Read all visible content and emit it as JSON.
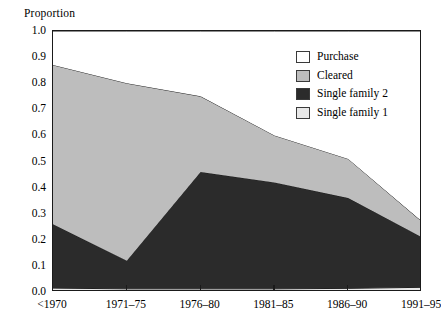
{
  "chart_data": {
    "type": "area",
    "stacked": true,
    "title": "",
    "subtitle": "",
    "xlabel": "",
    "ylabel": "Proportion",
    "ylim": [
      0.0,
      1.0
    ],
    "grid": false,
    "legend_position": "upper-right",
    "categories": [
      "<1970",
      "1971–75",
      "1976–80",
      "1981–85",
      "1986–90",
      "1991–95"
    ],
    "ytick_labels": [
      "0.0",
      "0.1",
      "0.2",
      "0.3",
      "0.4",
      "0.5",
      "0.6",
      "0.7",
      "0.8",
      "0.9",
      "1.0"
    ],
    "ytick_values": [
      0.0,
      0.1,
      0.2,
      0.3,
      0.4,
      0.5,
      0.6,
      0.7,
      0.8,
      0.9,
      1.0
    ],
    "stack_order_bottom_to_top": [
      "Single family 1",
      "Single family 2",
      "Cleared",
      "Purchase"
    ],
    "series": [
      {
        "name": "Single family 1",
        "color": "#e8e8e8",
        "values": [
          0.015,
          0.012,
          0.012,
          0.012,
          0.014,
          0.018
        ]
      },
      {
        "name": "Single family 2",
        "color": "#2b2b2b",
        "values": [
          0.245,
          0.108,
          0.448,
          0.408,
          0.346,
          0.192
        ]
      },
      {
        "name": "Cleared",
        "color": "#bdbdbd",
        "values": [
          0.61,
          0.68,
          0.29,
          0.18,
          0.15,
          0.06
        ]
      },
      {
        "name": "Purchase",
        "color": "#ffffff",
        "values": [
          0.13,
          0.2,
          0.25,
          0.4,
          0.49,
          0.73
        ]
      }
    ],
    "cumulative_tops": {
      "single_family_1": [
        0.015,
        0.012,
        0.012,
        0.012,
        0.014,
        0.018
      ],
      "single_family_2": [
        0.26,
        0.12,
        0.46,
        0.42,
        0.36,
        0.21
      ],
      "cleared": [
        0.87,
        0.8,
        0.75,
        0.6,
        0.51,
        0.27
      ],
      "purchase": [
        1.0,
        1.0,
        1.0,
        1.0,
        1.0,
        1.0
      ]
    }
  },
  "legend": {
    "items": [
      {
        "label": "Purchase",
        "color": "#ffffff"
      },
      {
        "label": "Cleared",
        "color": "#bdbdbd"
      },
      {
        "label": "Single family 2",
        "color": "#2b2b2b"
      },
      {
        "label": "Single family 1",
        "color": "#e8e8e8"
      }
    ]
  },
  "axis": {
    "y_title": "Proportion"
  },
  "colors": {
    "axis": "#1a1a1a",
    "background": "#ffffff",
    "series_line": "#1a1a1a"
  }
}
